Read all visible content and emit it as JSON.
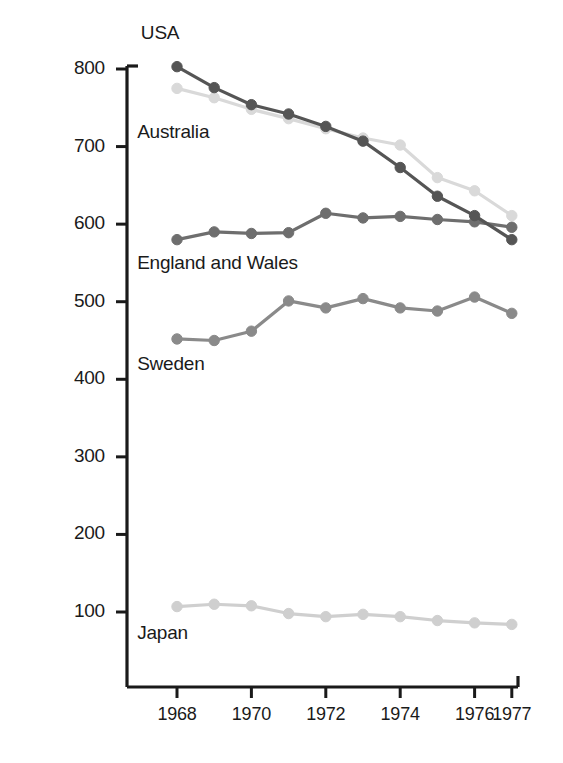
{
  "chart_data": {
    "type": "line",
    "title": "",
    "subtitle": "",
    "xlabel": "",
    "ylabel": "Rate per 100 000",
    "x": [
      1968,
      1969,
      1970,
      1971,
      1972,
      1973,
      1974,
      1975,
      1976,
      1977
    ],
    "xlim": [
      1967.6,
      1977.4
    ],
    "ylim": [
      40,
      800
    ],
    "xticks": [
      "1968",
      "1970",
      "1972",
      "1974",
      "1976",
      "1977"
    ],
    "xtick_values": [
      1968,
      1970,
      1972,
      1974,
      1976,
      1977
    ],
    "yticks": [
      "100",
      "200",
      "300",
      "400",
      "500",
      "600",
      "700",
      "800"
    ],
    "ytick_values": [
      100,
      200,
      300,
      400,
      500,
      600,
      700,
      800
    ],
    "grid": false,
    "legend_position": "inline-annotations",
    "series": [
      {
        "name": "USA",
        "color": "#555555",
        "label_x": 1968.05,
        "label_y": 845,
        "values": [
          803,
          776,
          754,
          742,
          726,
          707,
          673,
          636,
          611,
          580
        ]
      },
      {
        "name": "Australia",
        "color": "#d9d9d9",
        "label_x": 1967.95,
        "label_y": 718,
        "values": [
          775,
          763,
          748,
          736,
          723,
          711,
          702,
          660,
          643,
          611
        ]
      },
      {
        "name": "England and Wales",
        "color": "#6e6e6e",
        "label_x": 1967.95,
        "label_y": 548,
        "values": [
          580,
          590,
          588,
          589,
          614,
          608,
          610,
          606,
          603,
          596
        ]
      },
      {
        "name": "Sweden",
        "color": "#8a8a8a",
        "label_x": 1967.95,
        "label_y": 418,
        "values": [
          452,
          450,
          462,
          501,
          492,
          504,
          492,
          488,
          506,
          485
        ]
      },
      {
        "name": "Japan",
        "color": "#cfcfcf",
        "label_x": 1967.95,
        "label_y": 72,
        "values": [
          107,
          110,
          108,
          98,
          94,
          97,
          94,
          89,
          86,
          84
        ]
      }
    ]
  },
  "axes": {
    "axis_color": "#1a1a1a"
  }
}
